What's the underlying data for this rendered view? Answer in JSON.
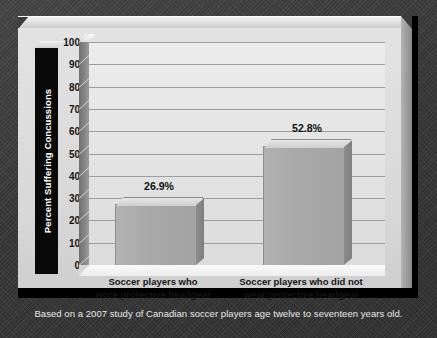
{
  "chart_data": {
    "type": "bar",
    "title": "",
    "xlabel": "",
    "ylabel": "Percent Suffering Concussions",
    "ylim": [
      0,
      100
    ],
    "grid": true,
    "legend": "none",
    "categories": [
      "Soccer players who\nwore protective headgear",
      "Soccer players who did not\nwear protective headgear"
    ],
    "category_lines": [
      [
        "Soccer players who",
        "wore protective headgear"
      ],
      [
        "Soccer players who did not",
        "wear protective headgear"
      ]
    ],
    "values": [
      26.9,
      52.8
    ],
    "value_labels": [
      "26.9%",
      "52.8%"
    ],
    "yticks": [
      0,
      10,
      20,
      30,
      40,
      50,
      60,
      70,
      80,
      90,
      100
    ],
    "ytick_labels": [
      "0",
      "10",
      "20",
      "30",
      "40",
      "50",
      "60",
      "70",
      "80",
      "90",
      "100"
    ],
    "caption": "Based on a 2007 study of Canadian soccer players age twelve to seventeen years old."
  },
  "axis": {
    "y_title": "Percent Suffering Concussions"
  },
  "colors": {
    "background": "#3c3c3c",
    "frame": "#000000",
    "panel": "#d8d8d8",
    "plot_background": "#e6e6e6",
    "gridline": "#9d9d9d",
    "bar_face": "#a9a9a9",
    "bar_top": "#dcdcdc",
    "bar_side": "#858585",
    "axis_title_panel": "#090909",
    "axis_title_text": "#ffffff",
    "tick_text": "#141414",
    "caption_text": "#e9e9e9"
  },
  "caption": {
    "text": "Based on a 2007 study of Canadian soccer players age twelve to seventeen years old."
  }
}
